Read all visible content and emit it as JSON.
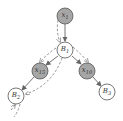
{
  "diagram": {
    "type": "factor-graph",
    "colors": {
      "observed_fill": "#a6a6a6",
      "latent_fill": "#ffffff",
      "stroke": "#555555",
      "edge": "#666666",
      "message": "#777777"
    },
    "nodes": [
      {
        "id": "x1",
        "label_base": "x",
        "label_sub": "1",
        "kind": "observed",
        "cx": 65,
        "cy": 16
      },
      {
        "id": "B1",
        "label_base": "B",
        "label_sub": "1",
        "kind": "latent",
        "cx": 65,
        "cy": 50
      },
      {
        "id": "x15",
        "label_base": "x",
        "label_sub": "15",
        "kind": "observed",
        "cx": 40,
        "cy": 71
      },
      {
        "id": "x10",
        "label_base": "x",
        "label_sub": "10",
        "kind": "observed",
        "cx": 87,
        "cy": 71
      },
      {
        "id": "B2",
        "label_base": "B",
        "label_sub": "2",
        "kind": "latent",
        "cx": 16,
        "cy": 96
      },
      {
        "id": "B3",
        "label_base": "B",
        "label_sub": "3",
        "kind": "latent",
        "cx": 107,
        "cy": 92
      }
    ],
    "edges": [
      {
        "from": "x1",
        "to": "B1"
      },
      {
        "from": "B1",
        "to": "x15"
      },
      {
        "from": "B1",
        "to": "x10"
      },
      {
        "from": "x15",
        "to": "B2"
      },
      {
        "from": "x10",
        "to": "B3"
      }
    ],
    "messages": [
      {
        "from": "x1",
        "to": "B1",
        "style": "dashed"
      },
      {
        "from": "B1",
        "to": "x15",
        "style": "dashed"
      },
      {
        "from": "B1",
        "to": "x10",
        "style": "dashed"
      },
      {
        "from": "B1",
        "to": "B2",
        "style": "dashed"
      },
      {
        "from": "B2",
        "to": "out",
        "style": "dashed"
      }
    ]
  }
}
